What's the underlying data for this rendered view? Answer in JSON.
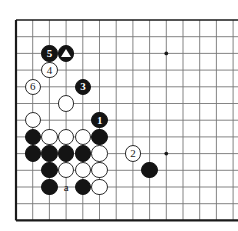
{
  "diagram": {
    "type": "go-board-problem-diagram",
    "caption": "",
    "board": {
      "cols": 14,
      "rows": 12,
      "origin_x": 16,
      "origin_y": 20,
      "spacing": 16.7,
      "line_color": "#777777",
      "edge_color": "#1a1a1a",
      "background": "#ffffff",
      "star_points": [
        {
          "col": 9,
          "row": 2
        },
        {
          "col": 9,
          "row": 8
        }
      ]
    },
    "stone_colors": {
      "black": "#141414",
      "white": "#ffffff",
      "white_outline": "#2b2b2b",
      "black_text": "#ffffff",
      "white_text": "#1a1a1a"
    },
    "stones": [
      {
        "id": "move-5",
        "color": "black",
        "col": 2,
        "row": 2,
        "label": "5",
        "marker": "none"
      },
      {
        "id": "marked-black-triangle",
        "color": "black",
        "col": 3,
        "row": 2,
        "label": "",
        "marker": "triangle"
      },
      {
        "id": "move-4",
        "color": "white",
        "col": 2,
        "row": 3,
        "label": "4",
        "marker": "none"
      },
      {
        "id": "move-6",
        "color": "white",
        "col": 1,
        "row": 4,
        "label": "6",
        "marker": "none"
      },
      {
        "id": "move-3",
        "color": "black",
        "col": 4,
        "row": 4,
        "label": "3",
        "marker": "none"
      },
      {
        "id": "white-c3r5",
        "color": "white",
        "col": 3,
        "row": 5,
        "label": "",
        "marker": "none"
      },
      {
        "id": "white-c1r6",
        "color": "white",
        "col": 1,
        "row": 6,
        "label": "",
        "marker": "none"
      },
      {
        "id": "move-1",
        "color": "black",
        "col": 5,
        "row": 6,
        "label": "1",
        "marker": "none"
      },
      {
        "id": "black-c1r7",
        "color": "black",
        "col": 1,
        "row": 7,
        "label": "",
        "marker": "none"
      },
      {
        "id": "white-c2r7",
        "color": "white",
        "col": 2,
        "row": 7,
        "label": "",
        "marker": "none"
      },
      {
        "id": "white-c3r7",
        "color": "white",
        "col": 3,
        "row": 7,
        "label": "",
        "marker": "none"
      },
      {
        "id": "white-c4r7",
        "color": "white",
        "col": 4,
        "row": 7,
        "label": "",
        "marker": "none"
      },
      {
        "id": "black-c5r7",
        "color": "black",
        "col": 5,
        "row": 7,
        "label": "",
        "marker": "none"
      },
      {
        "id": "black-c1r8",
        "color": "black",
        "col": 1,
        "row": 8,
        "label": "",
        "marker": "none"
      },
      {
        "id": "black-c2r8",
        "color": "black",
        "col": 2,
        "row": 8,
        "label": "",
        "marker": "none"
      },
      {
        "id": "black-c3r8",
        "color": "black",
        "col": 3,
        "row": 8,
        "label": "",
        "marker": "none"
      },
      {
        "id": "black-c4r8",
        "color": "black",
        "col": 4,
        "row": 8,
        "label": "",
        "marker": "none"
      },
      {
        "id": "white-c5r8",
        "color": "white",
        "col": 5,
        "row": 8,
        "label": "",
        "marker": "none"
      },
      {
        "id": "move-2",
        "color": "white",
        "col": 7,
        "row": 8,
        "label": "2",
        "marker": "none"
      },
      {
        "id": "black-c2r9",
        "color": "black",
        "col": 2,
        "row": 9,
        "label": "",
        "marker": "none"
      },
      {
        "id": "white-c3r9",
        "color": "white",
        "col": 3,
        "row": 9,
        "label": "",
        "marker": "none"
      },
      {
        "id": "white-c4r9",
        "color": "white",
        "col": 4,
        "row": 9,
        "label": "",
        "marker": "none"
      },
      {
        "id": "white-c5r9",
        "color": "white",
        "col": 5,
        "row": 9,
        "label": "",
        "marker": "none"
      },
      {
        "id": "black-c8r9",
        "color": "black",
        "col": 8,
        "row": 9,
        "label": "",
        "marker": "none"
      },
      {
        "id": "black-c2r10",
        "color": "black",
        "col": 2,
        "row": 10,
        "label": "",
        "marker": "none"
      },
      {
        "id": "black-c4r10",
        "color": "black",
        "col": 4,
        "row": 10,
        "label": "",
        "marker": "none"
      },
      {
        "id": "white-c5r10",
        "color": "white",
        "col": 5,
        "row": 10,
        "label": "",
        "marker": "none"
      }
    ],
    "point_labels": [
      {
        "id": "point-a",
        "text": "a",
        "col": 3,
        "row": 10
      }
    ]
  }
}
